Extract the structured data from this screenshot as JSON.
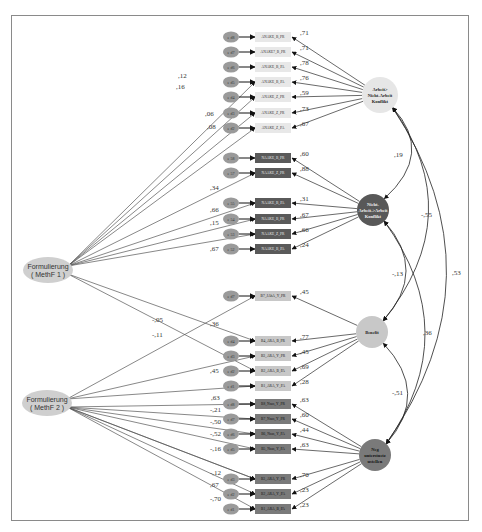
{
  "methods": [
    {
      "id": "m1",
      "line1": "Formulierung",
      "line2": "( MethF  1 )",
      "cx": 48,
      "cy": 270
    },
    {
      "id": "m2",
      "line1": "Formulierung",
      "line2": "( MethF  2 )",
      "cx": 47,
      "cy": 403
    }
  ],
  "latents": [
    {
      "id": "L1",
      "lines": [
        "Arbeit>",
        "Nicht-Arbeit",
        "Konflikt"
      ],
      "cx": 380,
      "cy": 95,
      "r": 18,
      "fill": "#e6e6e6",
      "text": "#222"
    },
    {
      "id": "L2",
      "lines": [
        "Nicht-",
        "Arbeit->Arbeit",
        "Konflikt"
      ],
      "cx": 373,
      "cy": 210,
      "r": 16,
      "fill": "#585858",
      "text": "#f2f2f2"
    },
    {
      "id": "L3",
      "lines": [
        "Benefit"
      ],
      "cx": 372,
      "cy": 332,
      "r": 16,
      "fill": "#c8c8c8",
      "text": "#222"
    },
    {
      "id": "L4",
      "lines": [
        "Neg",
        "unterstuetz",
        "ustellen"
      ],
      "cx": 375,
      "cy": 455,
      "r": 16,
      "fill": "#7a7a7a",
      "text": "#111"
    }
  ],
  "indicators": [
    {
      "err": "e d8",
      "label": "ANAKE_B_PR",
      "y": 37,
      "latent": "L1",
      "load": ",71",
      "fill": "#e8e8e8",
      "text": "#333"
    },
    {
      "err": "e d7",
      "label": "ANAKE7_B_PR",
      "y": 52,
      "latent": "L1",
      "load": ",71",
      "fill": "#e8e8e8",
      "text": "#333"
    },
    {
      "err": "e d6",
      "label": "ANAKE_B_PA",
      "y": 67,
      "latent": "L1",
      "load": ",78",
      "fill": "#e8e8e8",
      "text": "#333"
    },
    {
      "err": "e d5",
      "label": "ANAKE_B_PA",
      "y": 82,
      "latent": "L1",
      "load": ",76",
      "fill": "#e8e8e8",
      "text": "#333"
    },
    {
      "err": "e d4",
      "label": "ANAKE_Z_PR",
      "y": 97,
      "latent": "L1",
      "load": ",59",
      "fill": "#e8e8e8",
      "text": "#333"
    },
    {
      "err": "e d3",
      "label": "ANAKE_Z_PR",
      "y": 113,
      "latent": "L1",
      "load": ",73",
      "fill": "#e8e8e8",
      "text": "#333"
    },
    {
      "err": "e d2",
      "label": "ANAKE_Z_PA",
      "y": 128,
      "latent": "L1",
      "load": ",67",
      "fill": "#e8e8e8",
      "text": "#333"
    },
    {
      "err": "e 58",
      "label": "NAAKE_B_PR",
      "y": 158,
      "latent": "L2",
      "load": ",60",
      "fill": "#5a5a5a",
      "text": "#e8e8e8"
    },
    {
      "err": "e 57",
      "label": "NAAKE_Z_PR",
      "y": 173,
      "latent": "L2",
      "load": ",88",
      "fill": "#5a5a5a",
      "text": "#e8e8e8"
    },
    {
      "err": "e 55",
      "label": "NAAKE_B_PA",
      "y": 203,
      "latent": "L2",
      "load": ",31",
      "fill": "#5a5a5a",
      "text": "#e8e8e8"
    },
    {
      "err": "e 54",
      "label": "NAAKE_B_PR",
      "y": 219,
      "latent": "L2",
      "load": ",67",
      "fill": "#5a5a5a",
      "text": "#e8e8e8"
    },
    {
      "err": "e 53",
      "label": "NAAKE_Z_PR",
      "y": 234,
      "latent": "L2",
      "load": ",66",
      "fill": "#5a5a5a",
      "text": "#e8e8e8"
    },
    {
      "err": "e 52",
      "label": "NAAKE_B_PA",
      "y": 249,
      "latent": "L2",
      "load": ",24",
      "fill": "#5a5a5a",
      "text": "#e8e8e8"
    },
    {
      "err": "e d7",
      "label": "B7_JAhA_Y_PR",
      "y": 296,
      "latent": "L3",
      "load": ",45",
      "fill": "#c8c8c8",
      "text": "#222"
    },
    {
      "err": "e d4",
      "label": "B4_ARA_B_PR",
      "y": 341,
      "latent": "L3",
      "load": ",77",
      "fill": "#c8c8c8",
      "text": "#222"
    },
    {
      "err": "e d3",
      "label": "B3_ARA_Y_PR",
      "y": 356,
      "latent": "L3",
      "load": ",45",
      "fill": "#c8c8c8",
      "text": "#222"
    },
    {
      "err": "e d2",
      "label": "B2_ARA_B_PA",
      "y": 371,
      "latent": "L3",
      "load": ",69",
      "fill": "#c8c8c8",
      "text": "#222"
    },
    {
      "err": "e d1",
      "label": "B1_ARA_Y_PA",
      "y": 386,
      "latent": "L3",
      "load": ",28",
      "fill": "#c8c8c8",
      "text": "#222"
    },
    {
      "err": "e d8",
      "label": "B8_Nsus_Y_PR",
      "y": 404,
      "latent": "L4",
      "load": ",63",
      "fill": "#7a7a7a",
      "text": "#111"
    },
    {
      "err": "e d7",
      "label": "B7_Nsus_Y_PR",
      "y": 419,
      "latent": "L4",
      "load": ",60",
      "fill": "#7a7a7a",
      "text": "#111"
    },
    {
      "err": "e d6",
      "label": "B6_Nsus_Y_PA",
      "y": 434,
      "latent": "L4",
      "load": ",44",
      "fill": "#7a7a7a",
      "text": "#111"
    },
    {
      "err": "e d5",
      "label": "B5_Nsus_Y_PA",
      "y": 449,
      "latent": "L4",
      "load": ",63",
      "fill": "#7a7a7a",
      "text": "#111"
    },
    {
      "err": "e d3",
      "label": "B3_ARA_Y_PR",
      "y": 479,
      "latent": "L4",
      "load": ",70",
      "fill": "#7a7a7a",
      "text": "#111"
    },
    {
      "err": "e d2",
      "label": "B2_ARA_Y_PA",
      "y": 494,
      "latent": "L4",
      "load": ",23",
      "fill": "#7a7a7a",
      "text": "#111"
    },
    {
      "err": "e d1",
      "label": "B1_ARA_B_PA",
      "y": 509,
      "latent": "L4",
      "load": ",23",
      "fill": "#7a7a7a",
      "text": "#111"
    }
  ],
  "method_paths": [
    {
      "from": "m1",
      "to_index": 3,
      "label": ",12",
      "lx": 178,
      "ly": 78
    },
    {
      "from": "m1",
      "to_index": 4,
      "label": ",16",
      "lx": 176,
      "ly": 89
    },
    {
      "from": "m1",
      "to_index": 5,
      "label": ",06",
      "lx": 205,
      "ly": 116
    },
    {
      "from": "m1",
      "to_index": 6,
      "label": ",08",
      "lx": 207,
      "ly": 129
    },
    {
      "from": "m1",
      "to_index": 8,
      "label": ",34",
      "lx": 210,
      "ly": 190
    },
    {
      "from": "m1",
      "to_index": 9,
      "label": ",66",
      "lx": 210,
      "ly": 212
    },
    {
      "from": "m1",
      "to_index": 10,
      "label": ",15",
      "lx": 210,
      "ly": 225
    },
    {
      "from": "m1",
      "to_index": 11,
      "label": ",67",
      "lx": 210,
      "ly": 251
    },
    {
      "from": "m1",
      "to_index": 14,
      "label": ",36",
      "lx": 210,
      "ly": 326
    },
    {
      "from": "m1",
      "to_index": 16,
      "label": "-,11",
      "lx": 152,
      "ly": 337
    },
    {
      "from": "m2",
      "to_index": 13,
      "label": "-,05",
      "lx": 152,
      "ly": 322
    },
    {
      "from": "m2",
      "to_index": 15,
      "label": ",45",
      "lx": 210,
      "ly": 373
    },
    {
      "from": "m2",
      "to_index": 17,
      "label": "",
      "lx": 0,
      "ly": 0
    },
    {
      "from": "m2",
      "to_index": 18,
      "label": ",63",
      "lx": 211,
      "ly": 400
    },
    {
      "from": "m2",
      "to_index": 19,
      "label": "-,21",
      "lx": 210,
      "ly": 412
    },
    {
      "from": "m2",
      "to_index": 20,
      "label": "-,50",
      "lx": 210,
      "ly": 424
    },
    {
      "from": "m2",
      "to_index": 21,
      "label": "-,52",
      "lx": 210,
      "ly": 436
    },
    {
      "from": "m2",
      "to_index": 22,
      "label": "-,16",
      "lx": 210,
      "ly": 451
    },
    {
      "from": "m2",
      "to_index": 22,
      "label": "-,12",
      "lx": 210,
      "ly": 475
    },
    {
      "from": "m2",
      "to_index": 23,
      "label": ",67",
      "lx": 210,
      "ly": 487
    },
    {
      "from": "m2",
      "to_index": 24,
      "label": "-,70",
      "lx": 210,
      "ly": 501
    }
  ],
  "correlations": [
    {
      "from": "L1",
      "to": "L2",
      "label": ",19",
      "lx": 394,
      "ly": 157
    },
    {
      "from": "L1",
      "to": "L3",
      "label": "-,55",
      "lx": 421,
      "ly": 217
    },
    {
      "from": "L1",
      "to": "L4",
      "label": ",53",
      "lx": 452,
      "ly": 275
    },
    {
      "from": "L2",
      "to": "L3",
      "label": "-,13",
      "lx": 392,
      "ly": 276
    },
    {
      "from": "L2",
      "to": "L4",
      "label": ",36",
      "lx": 423,
      "ly": 335
    },
    {
      "from": "L3",
      "to": "L4",
      "label": "-,51",
      "lx": 392,
      "ly": 395
    }
  ]
}
